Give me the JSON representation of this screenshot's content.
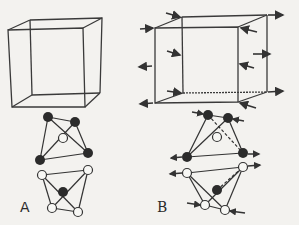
{
  "figure": {
    "labels": {
      "a": "A",
      "b": "B"
    },
    "colors": {
      "background": "#f3f2ef",
      "line": "#3a3a3a",
      "dark_atom": "#2b2b2b",
      "light_atom": "#f7f7f4"
    },
    "panels": [
      {
        "id": "A",
        "cube": "undistorted cube (no forces)",
        "molecules": [
          {
            "position": "top",
            "atoms": [
              "dark",
              "dark",
              "light",
              "dark",
              "dark"
            ]
          },
          {
            "position": "bottom",
            "atoms": [
              "light",
              "light",
              "dark",
              "light",
              "light"
            ]
          }
        ]
      },
      {
        "id": "B",
        "cube": "cube with arrows showing compression/tension at faces",
        "molecules": [
          {
            "position": "top",
            "atoms": [
              "dark",
              "dark",
              "light",
              "dark",
              "dark"
            ],
            "has_force_arrows": true,
            "has_dashed_bond": true
          },
          {
            "position": "bottom",
            "atoms": [
              "light",
              "light",
              "dark",
              "light",
              "light"
            ],
            "has_force_arrows": true,
            "has_dashed_bond": true
          }
        ]
      }
    ]
  }
}
